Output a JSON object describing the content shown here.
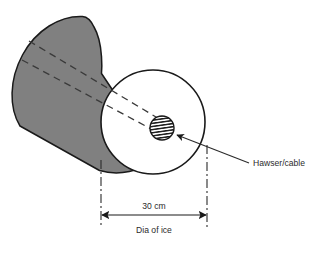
{
  "figure": {
    "labels": {
      "cable": "Hawser/cable",
      "dimension_value": "30 cm",
      "dimension_caption": "Dia of ice"
    },
    "icons": {
      "cable_arrow": "arrow-pointer-icon",
      "dim_arrow_left": "arrow-left-icon",
      "dim_arrow_right": "arrow-right-icon"
    },
    "colors": {
      "ice_body": "#808080",
      "ice_body_edge": "#1a1a1a",
      "front_face": "#ffffff",
      "cable_hatch": "#1a1a1a",
      "line": "#2b2b2b",
      "background": "#ffffff"
    },
    "geometry": {
      "front_circle_center_x": 153,
      "front_circle_center_y": 122,
      "front_circle_radius": 52,
      "cable_center_x": 162,
      "cable_center_y": 128,
      "cable_radius": 12,
      "dimension_left_x": 101,
      "dimension_right_x": 207,
      "dimension_line_y": 215
    }
  }
}
